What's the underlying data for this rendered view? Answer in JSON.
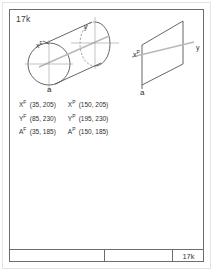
{
  "sheet": {
    "id_label": "17k",
    "title_block": {
      "left_cell": "",
      "middle_cell": "",
      "right_cell": "17k"
    }
  },
  "front_view": {
    "name": "cylinder-front-view",
    "labels": {
      "x": "x",
      "x_sup": "F",
      "y": "y",
      "a": "a"
    }
  },
  "side_view": {
    "name": "parallelogram-side-view",
    "labels": {
      "x": "x",
      "x_sup": "P",
      "y": "y",
      "a": "a"
    }
  },
  "coordinates": {
    "left_column": [
      {
        "symbol": "X",
        "sup": "F",
        "sub": "",
        "value": "(35, 205)"
      },
      {
        "symbol": "Y",
        "sup": "F",
        "sub": "",
        "value": "(85, 230)"
      },
      {
        "symbol": "A",
        "sup": "F",
        "sub": "",
        "value": "(35, 185)"
      }
    ],
    "right_column": [
      {
        "symbol": "X",
        "sup": "P",
        "sub": "",
        "value": "(150, 205)"
      },
      {
        "symbol": "Y",
        "sup": "P",
        "sub": "",
        "value": "(195, 230)"
      },
      {
        "symbol": "A",
        "sup": "P",
        "sub": "",
        "value": "(150, 185)"
      }
    ]
  },
  "colors": {
    "line": "#4a4a4a",
    "hidden": "#7d7d7d",
    "center": "#9a9a9a",
    "axis": "#b8b8b8",
    "frame": "#6d6d6d",
    "text": "#2f2f2f"
  }
}
